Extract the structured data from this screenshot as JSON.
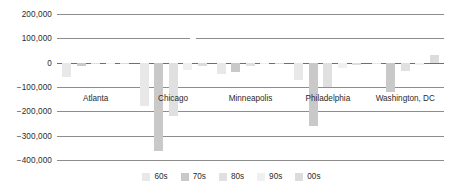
{
  "chart_data": {
    "type": "bar",
    "title": "",
    "subtitle": "",
    "xlabel": "",
    "ylabel": "",
    "orientation": "vertical",
    "grouping": "grouped",
    "grid": true,
    "grid_axis": "y",
    "legend_position": "bottom",
    "ylim": [
      -400000,
      200000
    ],
    "yticks": [
      200000,
      100000,
      0,
      -100000,
      -200000,
      -300000,
      -400000
    ],
    "ytick_labels": [
      "200,000",
      "100,000",
      "0",
      "−100,000",
      "−200,000",
      "−300,000",
      "−400,000"
    ],
    "categories": [
      "Atlanta",
      "Chicago",
      "Minneapolis",
      "Philadelphia",
      "Washington, DC"
    ],
    "series": [
      {
        "name": "60s",
        "color": "#e8e8e8",
        "values": [
          -60000,
          -180000,
          -45000,
          -70000,
          -5000
        ]
      },
      {
        "name": "70s",
        "color": "#c9c9c9",
        "values": [
          -15000,
          -365000,
          -40000,
          -260000,
          -120000
        ]
      },
      {
        "name": "80s",
        "color": "#e0e0e0",
        "values": [
          -3000,
          -220000,
          -15000,
          -100000,
          -35000
        ]
      },
      {
        "name": "90s",
        "color": "#f0f0f0",
        "values": [
          -2000,
          -30000,
          -4000,
          -20000,
          -10000
        ]
      },
      {
        "name": "00s",
        "color": "#dcdcdc",
        "values": [
          -2000,
          -15000,
          -3000,
          -8000,
          30000
        ]
      }
    ]
  },
  "legend": {
    "items": [
      {
        "label": "60s"
      },
      {
        "label": "70s"
      },
      {
        "label": "80s"
      },
      {
        "label": "90s"
      },
      {
        "label": "00s"
      }
    ]
  },
  "colors": {
    "gridline": "#8d8d8d",
    "zeroline": "#6f6f6f",
    "text": "#2b2b2b",
    "background": "#ffffff"
  }
}
